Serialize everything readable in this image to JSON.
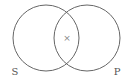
{
  "diagram": {
    "type": "venn",
    "sets": [
      {
        "label": "S",
        "cx": 46,
        "cy": 38,
        "r": 33
      },
      {
        "label": "P",
        "cx": 87,
        "cy": 38,
        "r": 33
      }
    ],
    "intersection_mark": "×",
    "colors": {
      "stroke": "#666666",
      "label": "#555555",
      "mark": "#888888",
      "background": "#ffffff"
    }
  }
}
